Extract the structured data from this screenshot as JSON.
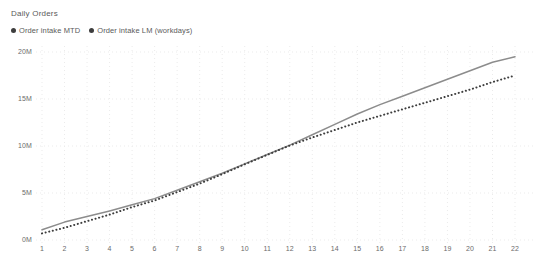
{
  "chart_data": {
    "type": "line",
    "title": "Daily Orders",
    "xlabel": "",
    "ylabel": "",
    "grid": true,
    "legend_position": "top-left",
    "xlim": [
      1,
      22
    ],
    "ylim": [
      0,
      20000000
    ],
    "y_ticks": [
      "0M",
      "5M",
      "10M",
      "15M",
      "20M"
    ],
    "y_tick_values": [
      0,
      5000000,
      10000000,
      15000000,
      20000000
    ],
    "categories": [
      1,
      2,
      3,
      4,
      5,
      6,
      7,
      8,
      9,
      10,
      11,
      12,
      13,
      14,
      15,
      16,
      17,
      18,
      19,
      20,
      21,
      22
    ],
    "x_tick_labels": [
      "1",
      "2",
      "3",
      "4",
      "5",
      "6",
      "7",
      "8",
      "9",
      "10",
      "11",
      "12",
      "13",
      "14",
      "15",
      "16",
      "17",
      "18",
      "19",
      "20",
      "21",
      "22"
    ],
    "series": [
      {
        "name": "Order intake MTD",
        "style": "solid",
        "color": "#8c8c8c",
        "values": [
          1100000,
          1900000,
          2500000,
          3100000,
          3750000,
          4400000,
          5300000,
          6200000,
          7100000,
          8100000,
          9100000,
          10100000,
          11200000,
          12300000,
          13400000,
          14400000,
          15300000,
          16200000,
          17100000,
          18000000,
          18900000,
          19500000
        ]
      },
      {
        "name": "Order intake LM (workdays)",
        "style": "dotted",
        "color": "#3d3d3d",
        "values": [
          700000,
          1300000,
          2000000,
          2700000,
          3500000,
          4200000,
          5100000,
          6000000,
          7000000,
          8050000,
          9050000,
          10050000,
          10900000,
          11700000,
          12500000,
          13200000,
          13900000,
          14600000,
          15300000,
          16000000,
          16800000,
          17500000
        ]
      }
    ]
  },
  "colors": {
    "grid": "#ebebeb",
    "axis_text": "#6b6b6b",
    "title_text": "#5a5a5a",
    "series_mtd": "#8c8c8c",
    "series_lm": "#3d3d3d"
  }
}
